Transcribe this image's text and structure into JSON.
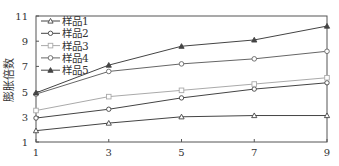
{
  "chart_data": {
    "type": "line",
    "title": "",
    "xlabel": "",
    "ylabel": "膨胀倍数",
    "x": [
      1,
      3,
      5,
      7,
      9
    ],
    "xticks": [
      "1",
      "3",
      "5",
      "7",
      "9"
    ],
    "yticks": [
      "1",
      "3",
      "5",
      "7",
      "9",
      "11"
    ],
    "xlim": [
      1,
      9
    ],
    "ylim": [
      1,
      11
    ],
    "grid": false,
    "legend_position": "upper left",
    "series": [
      {
        "name": "样品1",
        "marker": "triangle-open",
        "color": "#444444",
        "values": [
          1.9,
          2.5,
          3.0,
          3.1,
          3.1
        ]
      },
      {
        "name": "样品2",
        "marker": "circle-open",
        "color": "#444444",
        "values": [
          2.9,
          3.6,
          4.5,
          5.2,
          5.7
        ]
      },
      {
        "name": "样品3",
        "marker": "square-open",
        "color": "#aaaaaa",
        "values": [
          3.5,
          4.6,
          5.1,
          5.6,
          6.1
        ]
      },
      {
        "name": "样品4",
        "marker": "diamond-open",
        "color": "#666666",
        "values": [
          4.8,
          6.6,
          7.2,
          7.6,
          8.2
        ]
      },
      {
        "name": "样品5",
        "marker": "triangle-filled",
        "color": "#444444",
        "values": [
          4.9,
          7.1,
          8.6,
          9.1,
          10.2
        ]
      }
    ]
  }
}
